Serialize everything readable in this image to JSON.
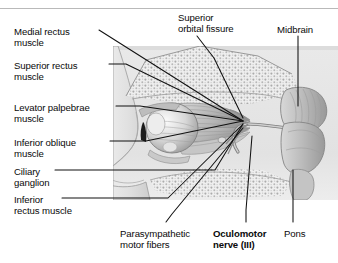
{
  "figure": {
    "colors": {
      "background": "#ffffff",
      "text": "#0a0a0a",
      "leader_line": "#111111",
      "illustration_light": "#e6e6e6",
      "illustration_mid": "#c2c2c2",
      "illustration_dark": "#8f8f8f",
      "frame_rule": "#b9b9b9"
    }
  },
  "labels": {
    "left": [
      {
        "id": "medial-rectus-muscle",
        "line1": "Medial rectus",
        "line2": "muscle",
        "x": 14,
        "y": 26
      },
      {
        "id": "superior-rectus-muscle",
        "line1": "Superior rectus",
        "line2": "muscle",
        "x": 14,
        "y": 60
      },
      {
        "id": "levator-palpebrae-muscle",
        "line1": "Levator palpebrae",
        "line2": "muscle",
        "x": 14,
        "y": 102
      },
      {
        "id": "inferior-oblique-muscle",
        "line1": "Inferior oblique",
        "line2": "muscle",
        "x": 14,
        "y": 137
      },
      {
        "id": "ciliary-ganglion",
        "line1": "Ciliary",
        "line2": "ganglion",
        "x": 14,
        "y": 166
      },
      {
        "id": "inferior-rectus-muscle",
        "line1": "Inferior",
        "line2": "rectus muscle",
        "x": 14,
        "y": 194
      }
    ],
    "top": [
      {
        "id": "superior-orbital-fissure",
        "line1": "Superior",
        "line2": "orbital fissure",
        "x": 178,
        "y": 12
      },
      {
        "id": "midbrain",
        "line1": "Midbrain",
        "line2": "",
        "x": 277,
        "y": 24
      }
    ],
    "bottom": [
      {
        "id": "parasympathetic-motor-fibers",
        "line1": "Parasympathetic",
        "line2": "motor fibers",
        "x": 120,
        "y": 228,
        "bold": false
      },
      {
        "id": "oculomotor-nerve-iii",
        "line1": "Oculomotor",
        "line2": "nerve (III)",
        "x": 213,
        "y": 228,
        "bold": true
      },
      {
        "id": "pons",
        "line1": "Pons",
        "line2": "",
        "x": 284,
        "y": 228,
        "bold": false
      }
    ]
  },
  "leader_lines": [
    {
      "id": "leader-medial-rectus",
      "points": "99,30 243,121"
    },
    {
      "id": "leader-superior-rectus",
      "points": "109,64 126,64 243,121"
    },
    {
      "id": "leader-levator-palpebrae",
      "points": "116,106 140,106 243,121"
    },
    {
      "id": "leader-inferior-oblique",
      "points": "110,141 146,141 243,121"
    },
    {
      "id": "leader-ciliary-ganglion",
      "points": "55,170 215,170 243,124"
    },
    {
      "id": "leader-inferior-rectus",
      "points": "62,198 168,198 243,124"
    },
    {
      "id": "leader-superior-orbital-fissure",
      "points": "197,36 214,58 243,118"
    },
    {
      "id": "leader-midbrain",
      "points": "298,36 298,106"
    },
    {
      "id": "leader-parasympathetic",
      "points": "166,222 172,214 243,128"
    },
    {
      "id": "leader-oculomotor-nerve",
      "points": "246,222 246,210 252,136"
    },
    {
      "id": "leader-pons",
      "points": "293,222 293,170"
    }
  ],
  "illustration": {
    "parts": [
      {
        "id": "skull-bone-region",
        "description": "stippled orbital bone of skull roof"
      },
      {
        "id": "face-profile",
        "description": "lateral profile of face with nose"
      },
      {
        "id": "eyeball",
        "description": "globe of the eye within the orbit"
      },
      {
        "id": "extraocular-muscles",
        "description": "fan of extraocular muscles behind globe"
      },
      {
        "id": "optic-nerve",
        "description": "nerve trunk running posteriorly"
      },
      {
        "id": "midbrain-body",
        "description": "striated midbrain of the brainstem"
      },
      {
        "id": "pons-body",
        "description": "pons below the midbrain"
      },
      {
        "id": "nerve-iii-trunk",
        "description": "oculomotor nerve from midbrain to orbit"
      }
    ]
  }
}
